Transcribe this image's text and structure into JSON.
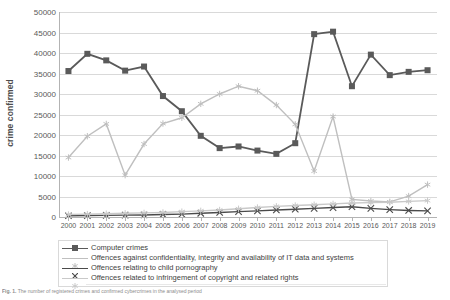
{
  "chart_data": {
    "type": "line",
    "title": "",
    "xlabel": "",
    "ylabel": "crime confirmed",
    "ylim": [
      0,
      50000
    ],
    "ytick_labels": [
      "50000",
      "45000",
      "40000",
      "35000",
      "30000",
      "25000",
      "20000",
      "15000",
      "10000",
      "5000",
      "0"
    ],
    "ytick_values": [
      50000,
      45000,
      40000,
      35000,
      30000,
      25000,
      20000,
      15000,
      10000,
      5000,
      0
    ],
    "grid": true,
    "legend_position": "bottom",
    "categories": [
      "2000",
      "2001",
      "2002",
      "2003",
      "2004",
      "2005",
      "2006",
      "2007",
      "2008",
      "2009",
      "2010",
      "2011",
      "2012",
      "2013",
      "2014",
      "2015",
      "2016",
      "2017",
      "2018",
      "2019"
    ],
    "series": [
      {
        "name": "Computer crimes",
        "color": "#5a5a5a",
        "marker": "square",
        "values": [
          35600,
          39800,
          38200,
          35700,
          36700,
          29500,
          25800,
          19800,
          16800,
          17200,
          16200,
          15400,
          18000,
          44600,
          45200,
          31900,
          39600,
          34600,
          35400,
          35800
        ]
      },
      {
        "name": "Offences against confidentiality, integrity and availability of IT data and systems",
        "color": "#bfbfbf",
        "marker": "star",
        "values": [
          14500,
          19700,
          22700,
          10200,
          17800,
          22800,
          24200,
          27600,
          30000,
          31900,
          30800,
          27300,
          22600,
          11200,
          24500,
          4300,
          3900,
          3700,
          5100,
          7900
        ]
      },
      {
        "name": "Offences relating to child pornography",
        "color": "#4a4a4a",
        "marker": "cross",
        "values": [
          300,
          350,
          400,
          450,
          500,
          600,
          700,
          900,
          1100,
          1300,
          1500,
          1700,
          1900,
          2100,
          2300,
          2500,
          2100,
          1800,
          1600,
          1500
        ]
      },
      {
        "name": "Offences related to infringement of copyright and related rights",
        "color": "#c9c9c9",
        "marker": "star",
        "values": [
          600,
          700,
          800,
          900,
          1000,
          1100,
          1300,
          1500,
          1700,
          2000,
          2300,
          2600,
          2800,
          3000,
          3200,
          3400,
          3500,
          3600,
          3800,
          4000
        ]
      }
    ]
  },
  "caption": {
    "label": "Fig. 1.",
    "text": "The number of registered crimes and confirmed cybercrimes in the analysed period"
  }
}
